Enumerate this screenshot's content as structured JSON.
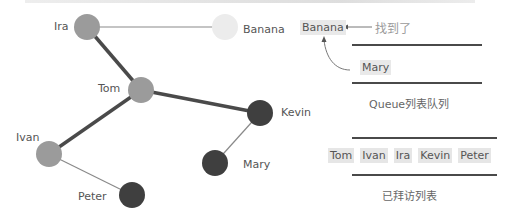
{
  "diagram": {
    "type": "graph-bfs-illustration",
    "nodes": [
      {
        "id": "ira",
        "label": "Ira",
        "fill": "#9b9b9b"
      },
      {
        "id": "banana",
        "label": "Banana",
        "fill": "#ececec"
      },
      {
        "id": "tom",
        "label": "Tom",
        "fill": "#9b9b9b"
      },
      {
        "id": "kevin",
        "label": "Kevin",
        "fill": "#3f3f3f"
      },
      {
        "id": "ivan",
        "label": "Ivan",
        "fill": "#9b9b9b"
      },
      {
        "id": "mary",
        "label": "Mary",
        "fill": "#3f3f3f"
      },
      {
        "id": "peter",
        "label": "Peter",
        "fill": "#3f3f3f"
      }
    ],
    "edges": [
      {
        "from": "ira",
        "to": "banana",
        "weight": "thin"
      },
      {
        "from": "ira",
        "to": "tom",
        "weight": "thick"
      },
      {
        "from": "tom",
        "to": "kevin",
        "weight": "thick"
      },
      {
        "from": "tom",
        "to": "ivan",
        "weight": "thick"
      },
      {
        "from": "kevin",
        "to": "mary",
        "weight": "thin"
      },
      {
        "from": "ivan",
        "to": "peter",
        "weight": "thin"
      }
    ]
  },
  "queue_panel": {
    "found_item": "Banana",
    "found_label": "找到了",
    "queue_items": [
      "Mary"
    ],
    "queue_caption": "Queue列表队列"
  },
  "visited_panel": {
    "items": [
      "Tom",
      "Ivan",
      "Ira",
      "Kevin",
      "Peter"
    ],
    "caption": "已拜访列表"
  },
  "colors": {
    "edge": "#4a4a4a",
    "thin_edge": "#8a8a8a",
    "highlight_bg": "#e8e8e8"
  }
}
